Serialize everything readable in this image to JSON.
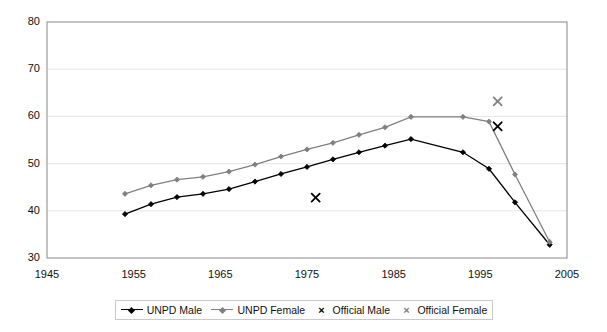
{
  "chart_data": {
    "type": "line",
    "title": "",
    "xlabel": "",
    "ylabel": "",
    "xlim": [
      1945,
      2005
    ],
    "ylim": [
      30,
      80
    ],
    "xticks": [
      1945,
      1955,
      1965,
      1975,
      1985,
      1995,
      2005
    ],
    "yticks": [
      30,
      40,
      50,
      60,
      70,
      80
    ],
    "grid": "horizontal",
    "legend_position": "bottom",
    "series": [
      {
        "name": "UNPD Male",
        "type": "line",
        "color": "#000000",
        "marker": "diamond",
        "x": [
          1954,
          1957,
          1960,
          1963,
          1966,
          1969,
          1972,
          1975,
          1978,
          1981,
          1984,
          1987,
          1993,
          1996,
          1999,
          2003
        ],
        "values": [
          39.3,
          41.4,
          42.9,
          43.6,
          44.6,
          46.2,
          47.8,
          49.3,
          50.9,
          52.4,
          53.8,
          55.2,
          52.4,
          48.9,
          41.8,
          32.8
        ]
      },
      {
        "name": "UNPD Female",
        "type": "line",
        "color": "#808080",
        "marker": "diamond",
        "x": [
          1954,
          1957,
          1960,
          1963,
          1966,
          1969,
          1972,
          1975,
          1978,
          1981,
          1984,
          1987,
          1993,
          1996,
          1999,
          2003
        ],
        "values": [
          43.6,
          45.4,
          46.6,
          47.2,
          48.3,
          49.8,
          51.5,
          53.0,
          54.4,
          56.1,
          57.7,
          59.9,
          59.9,
          58.9,
          47.7,
          33.4
        ]
      },
      {
        "name": "Official Male",
        "type": "scatter",
        "color": "#000000",
        "marker": "x",
        "x": [
          1976,
          1997
        ],
        "values": [
          42.8,
          57.9
        ]
      },
      {
        "name": "Official Female",
        "type": "scatter",
        "color": "#808080",
        "marker": "x",
        "x": [
          1997
        ],
        "values": [
          63.2
        ]
      }
    ],
    "legend": [
      {
        "label": "UNPD Male",
        "marker": "line-diamond",
        "color": "#000000"
      },
      {
        "label": "UNPD Female",
        "marker": "line-diamond",
        "color": "#808080"
      },
      {
        "label": "Official Male",
        "marker": "x",
        "color": "#000000"
      },
      {
        "label": "Official Female",
        "marker": "x",
        "color": "#808080"
      }
    ]
  }
}
